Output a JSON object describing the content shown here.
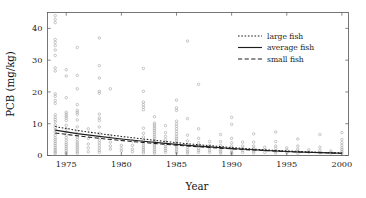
{
  "chart_data": {
    "type": "scatter",
    "title": "",
    "xlabel": "Year",
    "ylabel": "PCB (mg/kg)",
    "xlim": [
      1973.3,
      2000.6
    ],
    "ylim": [
      0,
      45
    ],
    "xticks": [
      1975,
      1980,
      1985,
      1990,
      1995,
      2000
    ],
    "xtick_labels": [
      "1975",
      "1980",
      "1985",
      "1990",
      "1995",
      "2000"
    ],
    "yticks": [
      0,
      10,
      20,
      30,
      40
    ],
    "ytick_labels": [
      "0",
      "10",
      "20",
      "30",
      "40"
    ],
    "grid": false,
    "legend_position": "top-right",
    "point_marker": "open-circle",
    "point_color": "#9a9a9a",
    "line_color": "#1e1e1e",
    "legend": [
      {
        "label": "large fish",
        "style": "dotted"
      },
      {
        "label": "average fish",
        "style": "solid"
      },
      {
        "label": "small fish",
        "style": "dashed"
      }
    ],
    "series": [
      {
        "name": "large fish",
        "style": "dotted",
        "x": [
          1974,
          1976,
          1978,
          1980,
          1982,
          1984,
          1986,
          1988,
          1990,
          1992,
          1994,
          1996,
          1998,
          2000
        ],
        "values": [
          9.1,
          7.9,
          6.9,
          6.0,
          5.2,
          4.4,
          3.7,
          3.1,
          2.5,
          2.0,
          1.6,
          1.3,
          1.0,
          0.8
        ]
      },
      {
        "name": "average fish",
        "style": "solid",
        "x": [
          1974,
          1976,
          1978,
          1980,
          1982,
          1984,
          1986,
          1988,
          1990,
          1992,
          1994,
          1996,
          1998,
          2000
        ],
        "values": [
          8.0,
          6.9,
          6.0,
          5.2,
          4.5,
          3.8,
          3.2,
          2.7,
          2.2,
          1.8,
          1.4,
          1.1,
          0.9,
          0.7
        ]
      },
      {
        "name": "small fish",
        "style": "dashed",
        "x": [
          1974,
          1976,
          1978,
          1980,
          1982,
          1984,
          1986,
          1988,
          1990,
          1992,
          1994,
          1996,
          1998,
          2000
        ],
        "values": [
          7.1,
          6.2,
          5.4,
          4.7,
          4.1,
          3.5,
          3.0,
          2.5,
          2.1,
          1.7,
          1.4,
          1.1,
          0.9,
          0.7
        ]
      }
    ],
    "points": [
      [
        1974,
        44.0
      ],
      [
        1974,
        42.8
      ],
      [
        1974,
        41.8
      ],
      [
        1974,
        36.5
      ],
      [
        1974,
        35.6
      ],
      [
        1974,
        34.6
      ],
      [
        1974,
        33.2
      ],
      [
        1974,
        31.5
      ],
      [
        1974,
        27.6
      ],
      [
        1974,
        26.6
      ],
      [
        1974,
        19.4
      ],
      [
        1974,
        18.6
      ],
      [
        1974,
        17.3
      ],
      [
        1974,
        16.4
      ],
      [
        1974,
        12.8
      ],
      [
        1974,
        12.0
      ],
      [
        1974,
        11.3
      ],
      [
        1974,
        10.6
      ],
      [
        1974,
        9.6
      ],
      [
        1974,
        8.8
      ],
      [
        1974,
        8.0
      ],
      [
        1974,
        7.2
      ],
      [
        1974,
        6.4
      ],
      [
        1974,
        5.6
      ],
      [
        1974,
        5.0
      ],
      [
        1974,
        4.4
      ],
      [
        1974,
        3.8
      ],
      [
        1974,
        3.2
      ],
      [
        1974,
        2.6
      ],
      [
        1974,
        2.0
      ],
      [
        1974,
        1.5
      ],
      [
        1974,
        1.0
      ],
      [
        1974,
        0.6
      ],
      [
        1975,
        27.0
      ],
      [
        1975,
        25.0
      ],
      [
        1975,
        18.2
      ],
      [
        1975,
        13.6
      ],
      [
        1975,
        13.0
      ],
      [
        1975,
        12.4
      ],
      [
        1975,
        11.8
      ],
      [
        1975,
        11.0
      ],
      [
        1975,
        9.5
      ],
      [
        1975,
        8.4
      ],
      [
        1975,
        7.4
      ],
      [
        1975,
        6.4
      ],
      [
        1975,
        5.6
      ],
      [
        1975,
        4.8
      ],
      [
        1975,
        4.0
      ],
      [
        1975,
        3.4
      ],
      [
        1975,
        2.8
      ],
      [
        1975,
        2.2
      ],
      [
        1975,
        1.6
      ],
      [
        1975,
        1.0
      ],
      [
        1975,
        0.6
      ],
      [
        1976,
        34.0
      ],
      [
        1976,
        25.2
      ],
      [
        1976,
        21.0
      ],
      [
        1976,
        16.0
      ],
      [
        1976,
        14.2
      ],
      [
        1976,
        13.6
      ],
      [
        1976,
        13.0
      ],
      [
        1976,
        11.2
      ],
      [
        1976,
        9.0
      ],
      [
        1976,
        7.6
      ],
      [
        1976,
        6.6
      ],
      [
        1976,
        5.8
      ],
      [
        1976,
        5.0
      ],
      [
        1976,
        4.2
      ],
      [
        1976,
        3.6
      ],
      [
        1976,
        3.0
      ],
      [
        1976,
        2.4
      ],
      [
        1976,
        1.8
      ],
      [
        1976,
        1.2
      ],
      [
        1976,
        0.7
      ],
      [
        1977,
        8.4
      ],
      [
        1977,
        5.4
      ],
      [
        1977,
        3.6
      ],
      [
        1977,
        2.4
      ],
      [
        1977,
        1.2
      ],
      [
        1978,
        37.0
      ],
      [
        1978,
        28.3
      ],
      [
        1978,
        24.4
      ],
      [
        1978,
        20.2
      ],
      [
        1978,
        19.6
      ],
      [
        1978,
        13.0
      ],
      [
        1978,
        11.8
      ],
      [
        1978,
        11.0
      ],
      [
        1978,
        9.0
      ],
      [
        1978,
        7.0
      ],
      [
        1978,
        5.8
      ],
      [
        1978,
        4.8
      ],
      [
        1978,
        4.0
      ],
      [
        1978,
        3.2
      ],
      [
        1978,
        2.4
      ],
      [
        1978,
        1.6
      ],
      [
        1978,
        1.0
      ],
      [
        1979,
        21.0
      ],
      [
        1979,
        6.2
      ],
      [
        1979,
        4.2
      ],
      [
        1979,
        3.0
      ],
      [
        1979,
        2.0
      ],
      [
        1980,
        5.0
      ],
      [
        1980,
        3.2
      ],
      [
        1980,
        2.2
      ],
      [
        1980,
        1.4
      ],
      [
        1981,
        4.6
      ],
      [
        1981,
        3.2
      ],
      [
        1981,
        2.0
      ],
      [
        1981,
        1.2
      ],
      [
        1982,
        27.4
      ],
      [
        1982,
        20.2
      ],
      [
        1982,
        16.8
      ],
      [
        1982,
        16.0
      ],
      [
        1982,
        15.2
      ],
      [
        1982,
        14.4
      ],
      [
        1982,
        8.6
      ],
      [
        1982,
        7.0
      ],
      [
        1982,
        5.8
      ],
      [
        1982,
        4.8
      ],
      [
        1982,
        4.0
      ],
      [
        1982,
        3.2
      ],
      [
        1982,
        2.6
      ],
      [
        1982,
        2.0
      ],
      [
        1982,
        1.4
      ],
      [
        1982,
        0.8
      ],
      [
        1983,
        12.2
      ],
      [
        1983,
        10.2
      ],
      [
        1983,
        9.6
      ],
      [
        1983,
        9.0
      ],
      [
        1983,
        8.4
      ],
      [
        1983,
        7.8
      ],
      [
        1983,
        7.2
      ],
      [
        1983,
        6.6
      ],
      [
        1983,
        6.0
      ],
      [
        1983,
        5.4
      ],
      [
        1983,
        4.8
      ],
      [
        1983,
        4.2
      ],
      [
        1983,
        3.6
      ],
      [
        1983,
        3.0
      ],
      [
        1983,
        2.4
      ],
      [
        1983,
        1.8
      ],
      [
        1983,
        1.2
      ],
      [
        1983,
        0.7
      ],
      [
        1984,
        9.4
      ],
      [
        1984,
        7.2
      ],
      [
        1984,
        6.0
      ],
      [
        1984,
        5.0
      ],
      [
        1984,
        4.2
      ],
      [
        1984,
        3.4
      ],
      [
        1984,
        2.8
      ],
      [
        1984,
        2.2
      ],
      [
        1984,
        1.6
      ],
      [
        1984,
        1.0
      ],
      [
        1985,
        17.4
      ],
      [
        1985,
        15.0
      ],
      [
        1985,
        14.2
      ],
      [
        1985,
        10.8
      ],
      [
        1985,
        10.0
      ],
      [
        1985,
        9.2
      ],
      [
        1985,
        8.4
      ],
      [
        1985,
        7.6
      ],
      [
        1985,
        6.8
      ],
      [
        1985,
        6.0
      ],
      [
        1985,
        5.4
      ],
      [
        1985,
        4.8
      ],
      [
        1985,
        4.2
      ],
      [
        1985,
        3.6
      ],
      [
        1985,
        3.0
      ],
      [
        1985,
        2.4
      ],
      [
        1985,
        1.8
      ],
      [
        1985,
        1.2
      ],
      [
        1985,
        0.7
      ],
      [
        1986,
        36.0
      ],
      [
        1986,
        11.6
      ],
      [
        1986,
        6.4
      ],
      [
        1986,
        4.6
      ],
      [
        1986,
        3.4
      ],
      [
        1986,
        2.6
      ],
      [
        1986,
        1.8
      ],
      [
        1986,
        1.2
      ],
      [
        1986,
        0.7
      ],
      [
        1987,
        22.4
      ],
      [
        1987,
        8.4
      ],
      [
        1987,
        5.4
      ],
      [
        1987,
        4.0
      ],
      [
        1987,
        3.0
      ],
      [
        1987,
        2.2
      ],
      [
        1987,
        1.6
      ],
      [
        1987,
        1.0
      ],
      [
        1988,
        4.4
      ],
      [
        1988,
        3.2
      ],
      [
        1988,
        2.4
      ],
      [
        1988,
        1.6
      ],
      [
        1988,
        1.0
      ],
      [
        1989,
        6.6
      ],
      [
        1989,
        4.4
      ],
      [
        1989,
        3.2
      ],
      [
        1989,
        2.4
      ],
      [
        1989,
        1.8
      ],
      [
        1989,
        1.2
      ],
      [
        1989,
        0.7
      ],
      [
        1990,
        12.0
      ],
      [
        1990,
        9.8
      ],
      [
        1990,
        5.4
      ],
      [
        1990,
        4.0
      ],
      [
        1990,
        3.0
      ],
      [
        1990,
        2.2
      ],
      [
        1990,
        1.6
      ],
      [
        1990,
        1.0
      ],
      [
        1990,
        0.6
      ],
      [
        1991,
        4.2
      ],
      [
        1991,
        3.0
      ],
      [
        1991,
        2.2
      ],
      [
        1991,
        1.6
      ],
      [
        1991,
        1.0
      ],
      [
        1992,
        6.8
      ],
      [
        1992,
        4.2
      ],
      [
        1992,
        3.0
      ],
      [
        1992,
        2.2
      ],
      [
        1992,
        1.4
      ],
      [
        1992,
        0.8
      ],
      [
        1993,
        2.6
      ],
      [
        1993,
        1.8
      ],
      [
        1993,
        1.0
      ],
      [
        1994,
        7.4
      ],
      [
        1994,
        4.4
      ],
      [
        1994,
        3.0
      ],
      [
        1994,
        2.2
      ],
      [
        1994,
        1.4
      ],
      [
        1994,
        0.8
      ],
      [
        1995,
        2.4
      ],
      [
        1995,
        1.6
      ],
      [
        1995,
        0.9
      ],
      [
        1996,
        5.2
      ],
      [
        1996,
        3.0
      ],
      [
        1996,
        2.0
      ],
      [
        1996,
        1.3
      ],
      [
        1996,
        0.7
      ],
      [
        1997,
        1.8
      ],
      [
        1997,
        1.0
      ],
      [
        1998,
        6.6
      ],
      [
        1998,
        2.6
      ],
      [
        1998,
        1.6
      ],
      [
        1998,
        0.9
      ],
      [
        1999,
        1.4
      ],
      [
        1999,
        0.8
      ],
      [
        2000,
        7.2
      ],
      [
        2000,
        5.0
      ],
      [
        2000,
        4.0
      ],
      [
        2000,
        3.2
      ],
      [
        2000,
        2.4
      ],
      [
        2000,
        1.8
      ],
      [
        2000,
        1.2
      ],
      [
        2000,
        0.7
      ]
    ]
  }
}
